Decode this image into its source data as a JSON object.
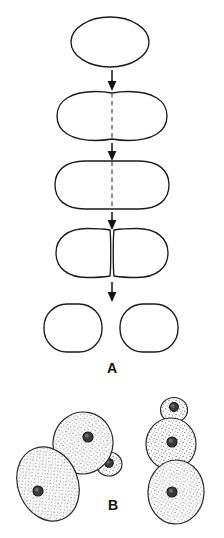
{
  "figure": {
    "background_color": "#ffffff",
    "outline_color": "#1a1a1a",
    "septum_color": "#4a4a4a",
    "nucleus_color": "#3a3a3a",
    "stipple_color": "#707070",
    "panels": [
      {
        "id": "A",
        "label": "A",
        "label_x": 112,
        "label_y": 368,
        "process": "binary fission",
        "stages": [
          {
            "index": 1,
            "shape": "oval",
            "cx": 110,
            "cy": 42,
            "rx": 39,
            "ry": 25,
            "septum": false,
            "description": "single undivided oval cell"
          },
          {
            "index": 2,
            "shape": "dumbbell",
            "cx": 112,
            "cy": 116,
            "rx": 56,
            "ry": 25,
            "waist": 13,
            "septum": true,
            "septum_x": 112,
            "septum_y1": 93,
            "septum_y2": 140,
            "description": "constricting cell with dashed septum"
          },
          {
            "index": 3,
            "shape": "rounded-rect",
            "cx": 112,
            "cy": 185,
            "rx": 57,
            "ry": 25,
            "septum": true,
            "septum_x": 112,
            "septum_y1": 162,
            "septum_y2": 209,
            "description": "elongated cell with dashed division plane"
          },
          {
            "index": 4,
            "shape": "pair-touching",
            "cx": 112,
            "cy": 253,
            "rx": 56,
            "ry": 25,
            "waist": 3,
            "septum": false,
            "description": "two daughter cells still touching"
          },
          {
            "index": 5,
            "shape": "pair-separated",
            "cx": 112,
            "cy": 328,
            "rx": 57,
            "ry": 25,
            "gap": 18,
            "septum": false,
            "description": "two fully separated daughter cells"
          }
        ],
        "arrows": [
          {
            "x": 112,
            "y1": 70,
            "y2": 89
          },
          {
            "x": 112,
            "y1": 143,
            "y2": 160
          },
          {
            "x": 112,
            "y1": 212,
            "y2": 229
          },
          {
            "x": 112,
            "y1": 280,
            "y2": 300
          }
        ]
      },
      {
        "id": "B",
        "label": "B",
        "label_x": 113,
        "label_y": 505,
        "process": "budding",
        "clusters": [
          {
            "name": "left-cluster",
            "cells": [
              {
                "role": "mother-cell-lower-left",
                "cx": 48,
                "cy": 484,
                "rx": 30,
                "ry": 38,
                "rotation": -22,
                "nucleus": {
                  "cx": 38,
                  "cy": 491,
                  "r": 5
                }
              },
              {
                "role": "mother-cell-upper",
                "cx": 83,
                "cy": 443,
                "rx": 30,
                "ry": 31,
                "rotation": 12,
                "nucleus": {
                  "cx": 88,
                  "cy": 437,
                  "r": 5
                }
              },
              {
                "role": "small-bud",
                "cx": 108,
                "cy": 463,
                "rx": 12,
                "ry": 11,
                "rotation": 0,
                "nucleus": {
                  "cx": 108,
                  "cy": 463,
                  "r": 4
                }
              }
            ]
          },
          {
            "name": "right-chain",
            "cells": [
              {
                "role": "small-bud-top",
                "cx": 174,
                "cy": 410,
                "rx": 13,
                "ry": 12,
                "rotation": 0,
                "nucleus": {
                  "cx": 174,
                  "cy": 407,
                  "r": 4
                }
              },
              {
                "role": "middle-cell",
                "cx": 171,
                "cy": 444,
                "rx": 25,
                "ry": 26,
                "rotation": 0,
                "nucleus": {
                  "cx": 172,
                  "cy": 442,
                  "r": 5
                }
              },
              {
                "role": "lower-cell",
                "cx": 176,
                "cy": 492,
                "rx": 28,
                "ry": 32,
                "rotation": 3,
                "nucleus": {
                  "cx": 172,
                  "cy": 492,
                  "r": 5
                }
              }
            ]
          }
        ]
      }
    ]
  }
}
